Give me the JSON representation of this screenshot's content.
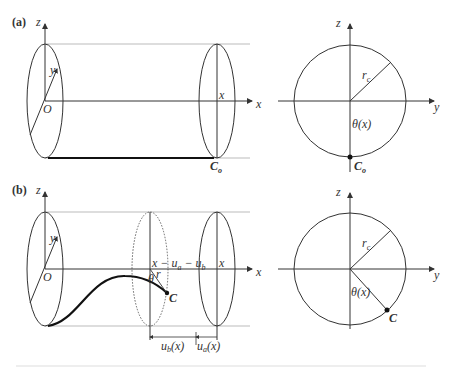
{
  "figure": {
    "panel_a": {
      "label": "(a)",
      "axes": {
        "z": "z",
        "y": "y",
        "x": "x",
        "origin": "O"
      },
      "section_label": "x",
      "point": "C",
      "point_sub": "o",
      "cross_section": {
        "axes": {
          "z": "z",
          "y": "y"
        },
        "radius_label": "r",
        "radius_sub": "c",
        "angle_label": "θ(x)",
        "point": "C",
        "point_sub": "o"
      }
    },
    "panel_b": {
      "label": "(b)",
      "axes": {
        "z": "z",
        "y": "y",
        "x": "x",
        "origin": "O"
      },
      "section_label_dashed": "x − u",
      "section_label_dashed_sub1": "a",
      "section_label_dashed_mid": " − u",
      "section_label_dashed_sub2": "b",
      "section_label": "x",
      "radius_label": "r",
      "angle_label": "θ",
      "point": "C",
      "dimension_b": "u",
      "dimension_b_sub": "b",
      "dimension_b_arg": "(x)",
      "dimension_a": "u",
      "dimension_a_sub": "a",
      "dimension_a_arg": "(x)",
      "cross_section": {
        "axes": {
          "z": "z",
          "y": "y"
        },
        "radius_label": "r",
        "radius_sub": "c",
        "angle_label": "θ(x)",
        "point": "C"
      }
    },
    "caption": "Fig. (illegible caption text)"
  }
}
